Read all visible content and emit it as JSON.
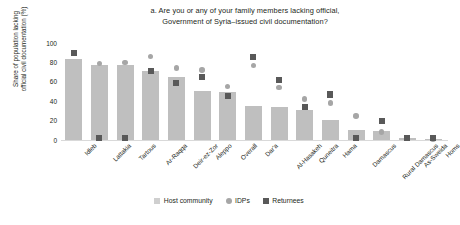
{
  "chart_data": {
    "type": "bar",
    "title": "a. Are you or any of your family members lacking official, Government of Syria–issued civil documentation?",
    "title_line1": "a. Are you or any of your family members lacking official,",
    "title_line2": "Government of Syria–issued civil documentation?",
    "xlabel": "",
    "ylabel": "Share of population lacking official civil documentation (%)",
    "ylabel_line1": "Share of population lacking",
    "ylabel_line2": "official civil documentation (%)",
    "ylim": [
      0,
      100
    ],
    "yticks": [
      0,
      20,
      40,
      60,
      80,
      100
    ],
    "grid": false,
    "legend_position": "bottom",
    "categories": [
      "Idleb",
      "Lattakia",
      "Tartous",
      "Ar-Raqqa",
      "Deir-ez-Zor",
      "Aleppo",
      "Overall",
      "Dar'a",
      "Al-Hasakeh",
      "Quneitra",
      "Hama",
      "Damascus",
      "Rural Damascus",
      "As-Sweida",
      "Homs"
    ],
    "series": [
      {
        "name": "Host community",
        "marker": "bar",
        "color": "#bfbfbf",
        "values": [
          84,
          77,
          77,
          71,
          65,
          51,
          49,
          35,
          34,
          31,
          21,
          10,
          9,
          2,
          1
        ]
      },
      {
        "name": "IDPs",
        "marker": "circle",
        "color": "#a6a6a6",
        "values": [
          90,
          79,
          80,
          86,
          74,
          72,
          55,
          77,
          54,
          42,
          38,
          25,
          8,
          2,
          1
        ]
      },
      {
        "name": "Returnees",
        "marker": "square",
        "color": "#595959",
        "values": [
          90,
          2,
          2,
          71,
          59,
          65,
          45,
          86,
          62,
          34,
          47,
          2,
          20,
          2,
          2
        ]
      }
    ]
  },
  "legend": {
    "items": [
      {
        "label": "Host community"
      },
      {
        "label": "IDPs"
      },
      {
        "label": "Returnees"
      }
    ]
  }
}
